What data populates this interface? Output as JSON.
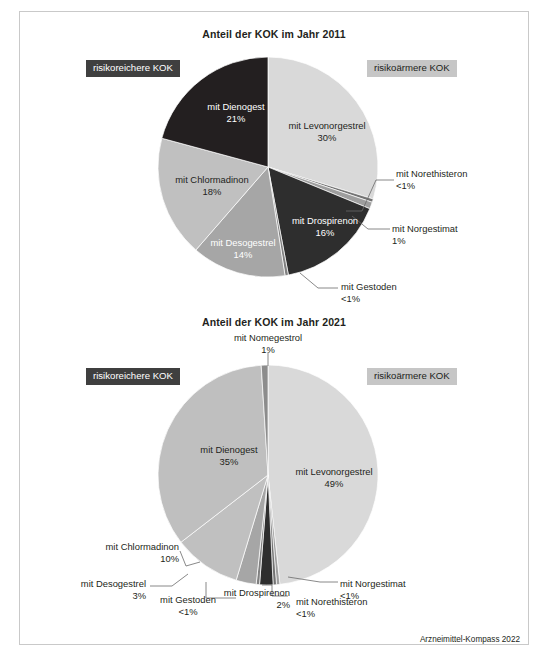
{
  "figure": {
    "footer": "Arzneimittel-Kompass 2022",
    "legend": {
      "higher_risk": "risikoreichere KOK",
      "lower_risk": "risikoärmere KOK"
    },
    "colors": {
      "dark_badge_bg": "#3f3f3f",
      "light_badge_bg": "#c6c6c6",
      "levonorgestrel": "#d9d9d9",
      "dienogest_2011": "#231f20",
      "dienogest_2021": "#bfbfbf",
      "chlormadinon": "#c0c0c0",
      "desogestrel": "#a6a6a6",
      "drospirenon": "#2e2e2e",
      "gestoden": "#808080",
      "norgestimat": "#9e9e9e",
      "norethisteron": "#737373",
      "nomegestrol": "#8c8c8c",
      "stroke": "#ffffff"
    }
  },
  "chart_data": [
    {
      "type": "pie",
      "title": "Anteil der KOK im Jahr 2011",
      "legend_position": "top-left and top-right badges",
      "categories": [
        "mit Levonorgestrel",
        "mit Norethisteron",
        "mit Norgestimat",
        "mit Drospirenon",
        "mit Gestoden",
        "mit Desogestrel",
        "mit Chlormadinon",
        "mit Dienogest"
      ],
      "values": [
        30,
        0.5,
        1,
        16,
        0.5,
        14,
        18,
        21
      ],
      "labels": [
        {
          "name": "mit Levonorgestrel",
          "pct": "30%",
          "risk": "niedriger",
          "placement": "inside"
        },
        {
          "name": "mit Norethisteron",
          "pct": "<1%",
          "risk": "niedriger",
          "placement": "callout"
        },
        {
          "name": "mit Norgestimat",
          "pct": "1%",
          "risk": "niedriger",
          "placement": "callout"
        },
        {
          "name": "mit Drospirenon",
          "pct": "16%",
          "risk": "hoeher",
          "placement": "inside"
        },
        {
          "name": "mit Gestoden",
          "pct": "<1%",
          "risk": "hoeher",
          "placement": "callout"
        },
        {
          "name": "mit Desogestrel",
          "pct": "14%",
          "risk": "hoeher",
          "placement": "inside"
        },
        {
          "name": "mit Chlormadinon",
          "pct": "18%",
          "risk": "hoeher",
          "placement": "inside"
        },
        {
          "name": "mit Dienogest",
          "pct": "21%",
          "risk": "hoeher",
          "placement": "inside"
        }
      ]
    },
    {
      "type": "pie",
      "title": "Anteil der KOK im Jahr 2021",
      "legend_position": "top-left and top-right badges",
      "categories": [
        "mit Levonorgestrel",
        "mit Norgestimat",
        "mit Norethisteron",
        "mit Drospirenon",
        "mit Gestoden",
        "mit Desogestrel",
        "mit Chlormadinon",
        "mit Dienogest",
        "mit Nomegestrol"
      ],
      "values": [
        49,
        0.5,
        0.5,
        2,
        0.5,
        3,
        10,
        35,
        1
      ],
      "labels": [
        {
          "name": "mit Levonorgestrel",
          "pct": "49%",
          "risk": "niedriger",
          "placement": "inside"
        },
        {
          "name": "mit Norgestimat",
          "pct": "<1%",
          "risk": "niedriger",
          "placement": "callout"
        },
        {
          "name": "mit Norethisteron",
          "pct": "<1%",
          "risk": "niedriger",
          "placement": "callout"
        },
        {
          "name": "mit Drospirenon",
          "pct": "2%",
          "risk": "hoeher",
          "placement": "callout"
        },
        {
          "name": "mit Gestoden",
          "pct": "<1%",
          "risk": "hoeher",
          "placement": "callout"
        },
        {
          "name": "mit Desogestrel",
          "pct": "3%",
          "risk": "hoeher",
          "placement": "callout"
        },
        {
          "name": "mit Chlormadinon",
          "pct": "10%",
          "risk": "hoeher",
          "placement": "callout"
        },
        {
          "name": "mit Dienogest",
          "pct": "35%",
          "risk": "hoeher",
          "placement": "inside"
        },
        {
          "name": "mit Nomegestrol",
          "pct": "1%",
          "risk": "hoeher",
          "placement": "callout"
        }
      ]
    }
  ],
  "chart1": {
    "title": "Anteil der KOK im Jahr 2011",
    "badge_left": "risikoreichere KOK",
    "badge_right": "risikoärmere KOK",
    "s_levo_name": "mit Levonorgestrel",
    "s_levo_pct": "30%",
    "s_nore_name": "mit Norethisteron",
    "s_nore_pct": "<1%",
    "s_norg_name": "mit Norgestimat",
    "s_norg_pct": "1%",
    "s_dros_name": "mit Drospirenon",
    "s_dros_pct": "16%",
    "s_gest_name": "mit Gestoden",
    "s_gest_pct": "<1%",
    "s_deso_name": "mit Desogestrel",
    "s_deso_pct": "14%",
    "s_chlo_name": "mit Chlormadinon",
    "s_chlo_pct": "18%",
    "s_dien_name": "mit Dienogest",
    "s_dien_pct": "21%"
  },
  "chart2": {
    "title": "Anteil der KOK im Jahr 2021",
    "badge_left": "risikoreichere KOK",
    "badge_right": "risikoärmere KOK",
    "s_nome_name": "mit Nomegestrol",
    "s_nome_pct": "1%",
    "s_levo_name": "mit Levonorgestrel",
    "s_levo_pct": "49%",
    "s_dien_name": "mit Dienogest",
    "s_dien_pct": "35%",
    "s_chlo_name": "mit Chlormadinon",
    "s_chlo_pct": "10%",
    "s_deso_name": "mit Desogestrel",
    "s_deso_pct": "3%",
    "s_gest_name": "mit Gestoden",
    "s_gest_pct": "<1%",
    "s_dros_name": "mit Drospirenon",
    "s_dros_pct": "2%",
    "s_nore_name": "mit Norethisteron",
    "s_nore_pct": "<1%",
    "s_norg_name": "mit Norgestimat",
    "s_norg_pct": "<1%"
  }
}
